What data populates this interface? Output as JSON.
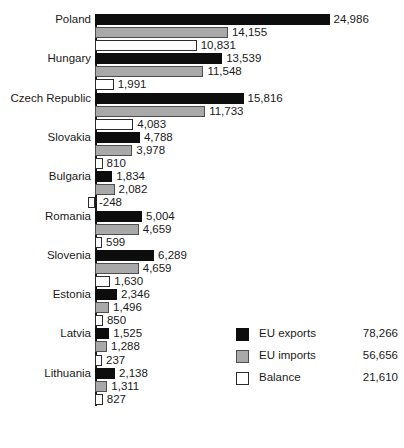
{
  "chart_data": {
    "type": "bar",
    "orientation": "horizontal",
    "grouped": true,
    "title": "",
    "xlabel": "",
    "ylabel": "",
    "grid": false,
    "xlim": [
      -1000,
      26000
    ],
    "categories": [
      "Poland",
      "Hungary",
      "Czech Republic",
      "Slovakia",
      "Bulgaria",
      "Romania",
      "Slovenia",
      "Estonia",
      "Latvia",
      "Lithuania"
    ],
    "series": [
      {
        "name": "EU exports",
        "color": "#0d0d0d",
        "total": 78266,
        "total_label": "78,266",
        "values": [
          24986,
          13539,
          15816,
          4788,
          1834,
          5004,
          6289,
          2346,
          1525,
          2138
        ],
        "labels": [
          "24,986",
          "13,539",
          "15,816",
          "4,788",
          "1,834",
          "5,004",
          "6,289",
          "2,346",
          "1,525",
          "2,138"
        ]
      },
      {
        "name": "EU imports",
        "color": "#a9a9a9",
        "total": 56656,
        "total_label": "56,656",
        "values": [
          14155,
          11548,
          11733,
          3978,
          2082,
          4659,
          4659,
          1496,
          1288,
          1311
        ],
        "labels": [
          "14,155",
          "11,548",
          "11,733",
          "3,978",
          "2,082",
          "4,659",
          "4,659",
          "1,496",
          "1,288",
          "1,311"
        ]
      },
      {
        "name": "Balance",
        "color": "#ffffff",
        "total": 21610,
        "total_label": "21,610",
        "values": [
          10831,
          1991,
          4083,
          810,
          -248,
          599,
          1630,
          850,
          237,
          827
        ],
        "labels": [
          "10,831",
          "1,991",
          "4,083",
          "810",
          "-248",
          "599",
          "1,630",
          "850",
          "237",
          "827"
        ]
      }
    ],
    "legend": {
      "position": "bottom-right",
      "entries": [
        {
          "label": "EU exports",
          "swatch": "exports",
          "total": "78,266"
        },
        {
          "label": "EU imports",
          "swatch": "imports",
          "total": "56,656"
        },
        {
          "label": "Balance",
          "swatch": "balance",
          "total": "21,610"
        }
      ]
    }
  }
}
